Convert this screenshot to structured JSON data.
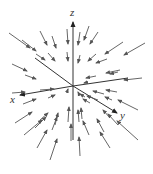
{
  "diagram": {
    "type": "vector-field-3d",
    "colors": {
      "stroke": "#555555",
      "axis": "#333333",
      "background": "#ffffff"
    },
    "origin": [
      73,
      86
    ],
    "axes": [
      {
        "name": "z",
        "label": "z",
        "end": [
          73,
          22
        ],
        "label_pos": [
          70,
          16
        ],
        "arrow": true
      },
      {
        "name": "x",
        "label": "x",
        "end": [
          20,
          95
        ],
        "label_pos": [
          10,
          103
        ],
        "arrow": true
      },
      {
        "name": "y",
        "label": "y",
        "end": [
          117,
          113
        ],
        "label_pos": [
          120,
          119
        ],
        "arrow": true
      },
      {
        "name": "x-neg",
        "label": "",
        "end": [
          128,
          78
        ],
        "label_pos": null,
        "arrow": false
      },
      {
        "name": "z-neg",
        "label": "",
        "end": [
          73,
          140
        ],
        "label_pos": null,
        "arrow": false
      },
      {
        "name": "y-neg",
        "label": "",
        "end": [
          35,
          58
        ],
        "label_pos": null,
        "arrow": false
      }
    ],
    "arrows": [
      [
        9,
        33,
        30,
        48
      ],
      [
        22,
        40,
        36,
        51
      ],
      [
        40,
        31,
        47,
        45
      ],
      [
        52,
        36,
        56,
        48
      ],
      [
        67,
        29,
        68,
        44
      ],
      [
        80,
        32,
        78,
        45
      ],
      [
        89,
        26,
        84,
        40
      ],
      [
        98,
        32,
        90,
        44
      ],
      [
        123,
        42,
        105,
        54
      ],
      [
        145,
        43,
        124,
        55
      ],
      [
        12,
        64,
        27,
        71
      ],
      [
        25,
        75,
        36,
        79
      ],
      [
        36,
        54,
        45,
        60
      ],
      [
        48,
        53,
        55,
        61
      ],
      [
        67,
        52,
        68,
        61
      ],
      [
        80,
        55,
        78,
        63
      ],
      [
        96,
        54,
        88,
        61
      ],
      [
        107,
        59,
        96,
        63
      ],
      [
        120,
        70,
        106,
        73
      ],
      [
        142,
        78,
        124,
        80
      ],
      [
        118,
        72,
        110,
        74
      ],
      [
        96,
        76,
        86,
        78
      ],
      [
        88,
        82,
        84,
        83
      ],
      [
        12,
        93,
        25,
        92
      ],
      [
        40,
        90,
        54,
        89
      ],
      [
        23,
        104,
        36,
        99
      ],
      [
        48,
        98,
        55,
        95
      ],
      [
        67,
        92,
        68,
        89
      ],
      [
        79,
        94,
        78,
        92
      ],
      [
        85,
        97,
        80,
        94
      ],
      [
        90,
        103,
        83,
        99
      ],
      [
        98,
        100,
        87,
        96
      ],
      [
        104,
        94,
        93,
        91
      ],
      [
        117,
        92,
        106,
        90
      ],
      [
        138,
        110,
        118,
        100
      ],
      [
        112,
        100,
        105,
        97
      ],
      [
        15,
        123,
        32,
        112
      ],
      [
        24,
        135,
        42,
        120
      ],
      [
        35,
        128,
        46,
        117
      ],
      [
        40,
        120,
        48,
        113
      ],
      [
        52,
        130,
        57,
        117
      ],
      [
        55,
        125,
        58,
        113
      ],
      [
        68,
        122,
        69,
        107
      ],
      [
        71,
        141,
        71,
        124
      ],
      [
        79,
        122,
        78,
        110
      ],
      [
        82,
        119,
        81,
        108
      ],
      [
        89,
        135,
        83,
        121
      ],
      [
        104,
        132,
        97,
        119
      ],
      [
        110,
        118,
        103,
        110
      ],
      [
        118,
        125,
        108,
        114
      ],
      [
        138,
        140,
        117,
        121
      ],
      [
        37,
        148,
        47,
        130
      ],
      [
        50,
        160,
        57,
        139
      ],
      [
        80,
        156,
        79,
        137
      ],
      [
        110,
        148,
        100,
        132
      ]
    ]
  }
}
